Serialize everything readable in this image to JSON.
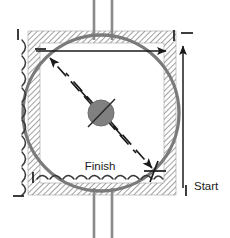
{
  "figure": {
    "canvas": {
      "width": 230,
      "height": 238,
      "background": "#ffffff"
    }
  },
  "colors": {
    "circle_stroke": "#7a7a7a",
    "hub_fill": "#808080",
    "hub_stroke": "#6e6e6e",
    "pipe_stroke": "#8a8a8a",
    "hatch_stroke": "#555555",
    "arrow_stroke": "#1a1a1a",
    "text": "#1a1a1a",
    "spring_stroke": "#3a3a3a"
  },
  "labels": {
    "finish": "Finish",
    "start": "Start"
  },
  "geometry": {
    "circle": {
      "cx": 101,
      "cy": 113,
      "r": 78,
      "stroke_width": 3.2
    },
    "hub": {
      "cx": 101,
      "cy": 113,
      "r": 13
    },
    "hatch_frame": {
      "x": 28,
      "y": 31,
      "width": 148,
      "height": 164,
      "band": 12
    },
    "pipe_top": {
      "x1": 94,
      "x2": 112,
      "y_top": 0,
      "y_bottom": 38
    },
    "pipe_bottom": {
      "x1": 94,
      "x2": 112,
      "y_top": 190,
      "y_bottom": 238
    }
  },
  "annotations": {
    "horizontal_arrow": {
      "x1": 36,
      "y1": 51,
      "x2": 168,
      "y2": 51,
      "direction": "right"
    },
    "vertical_arrow": {
      "x1": 183,
      "y1": 186,
      "x2": 183,
      "y2": 44,
      "direction": "up"
    },
    "diagonal_arrow_nw_outer": {
      "x1": 104,
      "y1": 119,
      "x2": 48,
      "y2": 56,
      "direction": "up-left"
    },
    "diagonal_arrow_nw_inner": {
      "x1": 118,
      "y1": 133,
      "x2": 62,
      "y2": 70,
      "direction": "up-left"
    },
    "diagonal_arrow_se_outer": {
      "x1": 98,
      "y1": 107,
      "x2": 154,
      "y2": 170,
      "direction": "down-right"
    },
    "diagonal_arrow_se_inner": {
      "x1": 84,
      "y1": 93,
      "x2": 140,
      "y2": 156,
      "direction": "down-right"
    },
    "tick_marks": [
      {
        "name": "tick-top-left-vertical",
        "x": 18,
        "y": 34,
        "orient": "vertical"
      },
      {
        "name": "tick-top-left-dash",
        "x": 36,
        "y": 50,
        "orient": "horizontal"
      },
      {
        "name": "tick-top-right-vertical",
        "x": 176,
        "y": 35,
        "orient": "vertical"
      },
      {
        "name": "tick-top-right-dash",
        "x": 190,
        "y": 35,
        "orient": "horizontal"
      },
      {
        "name": "tick-bottom-left-vertical",
        "x": 33,
        "y": 177,
        "orient": "vertical"
      },
      {
        "name": "tick-bottom-left-dash",
        "x": 18,
        "y": 196,
        "orient": "horizontal"
      },
      {
        "name": "tick-bottom-right-vertical",
        "x": 186,
        "y": 190,
        "orient": "vertical"
      },
      {
        "name": "tick-start-cross",
        "x": 152,
        "y": 172,
        "orient": "cross"
      }
    ],
    "spring_left": {
      "x": 22,
      "y_top": 38,
      "y_bottom": 192,
      "loops": 11
    },
    "spring_bottom": {
      "y": 178,
      "x_left": 36,
      "x_right": 160,
      "loops": 13
    }
  }
}
